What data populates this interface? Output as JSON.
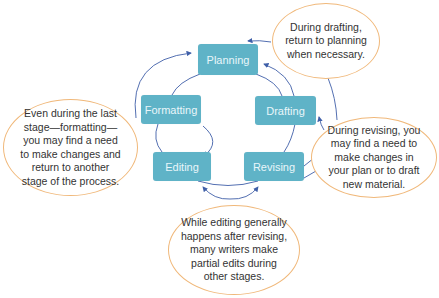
{
  "diagram": {
    "type": "cycle",
    "colors": {
      "stage_fill": "#5fb3c7",
      "stage_text": "#e9f6fa",
      "arrow": "#3f5fa8",
      "bubble_border": "#f0b87a"
    },
    "stages": [
      {
        "label": "Planning"
      },
      {
        "label": "Drafting"
      },
      {
        "label": "Revising"
      },
      {
        "label": "Editing"
      },
      {
        "label": "Formatting"
      }
    ],
    "notes": {
      "drafting": [
        "During drafting,",
        "return to planning",
        "when necessary."
      ],
      "revising": [
        "During revising, you",
        "may find a need to",
        "make changes in",
        "your plan or to draft",
        "new material."
      ],
      "editing": [
        "While editing generally",
        "happens after revising,",
        "many writers make",
        "partial edits during",
        "other stages."
      ],
      "formatting": [
        "Even during the last",
        "stage—formatting—",
        "you may find a need",
        "to make changes and",
        "return to another",
        "stage of the process."
      ]
    }
  }
}
